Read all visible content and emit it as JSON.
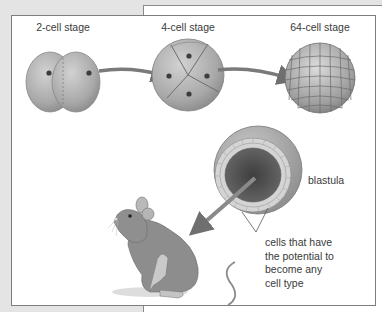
{
  "figure": {
    "stages": [
      {
        "label": "2-cell stage",
        "cells": 2
      },
      {
        "label": "4-cell stage",
        "cells": 4
      },
      {
        "label": "64-cell stage",
        "cells": 64
      }
    ],
    "blastula_label": "blastula",
    "callout_lines": [
      "cells that have",
      "the potential to",
      "become any",
      "cell type"
    ],
    "organism": "mouse",
    "colors": {
      "background": "#e4e4e4",
      "card": "#ffffff",
      "border": "#7d7d7d",
      "cell_fill": "#a8a8a8",
      "arrow": "#7a7a7a",
      "text": "#3a3a3a"
    }
  }
}
